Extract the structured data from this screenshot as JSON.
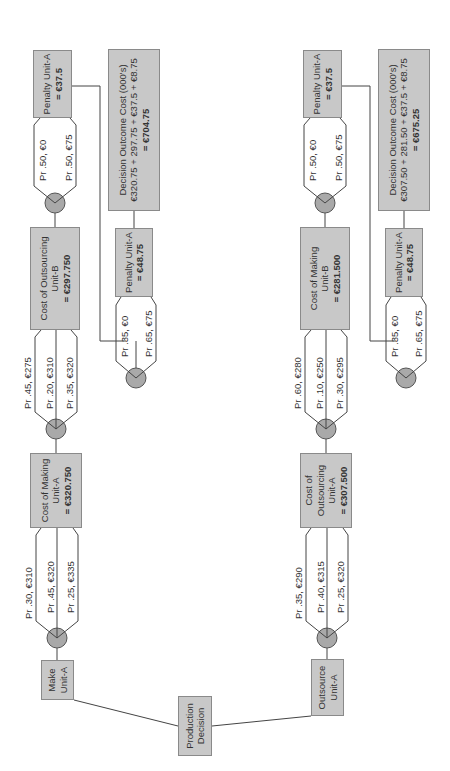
{
  "root": {
    "label_1": "Production",
    "label_2": "Decision"
  },
  "branches": [
    {
      "decision_1": "Make",
      "decision_2": "Unit-A",
      "stage1": {
        "outcomes": [
          "Pr .30, €310",
          "Pr .45, €320",
          "Pr .25, €335"
        ],
        "box_line1": "Cost of Making",
        "box_line2": "Unit-A",
        "box_value": "= €320.750"
      },
      "stage2": {
        "outcomes": [
          "Pr .45, €275",
          "Pr .20, €310",
          "Pr .35, €320"
        ],
        "box_line1": "Cost of Outsourcing",
        "box_line2": "Unit-B",
        "box_value": "= €297.750"
      },
      "penalty_low": {
        "outcomes": [
          "Pr .35, €0",
          "Pr .65, €75"
        ],
        "box_line1": "Penalty Unit-A",
        "box_value": "= €48.75"
      },
      "penalty_high": {
        "outcomes": [
          "Pr .50, €0",
          "Pr .50, €75"
        ],
        "box_line1": "Penalty Unit-A",
        "box_value": "= €37.5"
      },
      "outcome": {
        "title": "Decision  Outcome Cost (000's)",
        "formula": "€320.75 + 297.75 + €37.5 + €8.75",
        "total": "= €704.75"
      }
    },
    {
      "decision_1": "Outsource",
      "decision_2": "Unit-A",
      "stage1": {
        "outcomes": [
          "Pr .35, €290",
          "Pr .40, €315",
          "Pr .25, €320"
        ],
        "box_line1": "Cost of",
        "box_line2": "Outsourcing",
        "box_line3": "Unit-A",
        "box_value": "= €307.500"
      },
      "stage2": {
        "outcomes": [
          "Pr .60, €280",
          "Pr .10, €250",
          "Pr .30, €295"
        ],
        "box_line1": "Cost of Making",
        "box_line2": "Unit-B",
        "box_value": "= €281.500"
      },
      "penalty_low": {
        "outcomes": [
          "Pr .35, €0",
          "Pr .65, €75"
        ],
        "box_line1": "Penalty Unit-A",
        "box_value": "= €48.75"
      },
      "penalty_high": {
        "outcomes": [
          "Pr .50, €0",
          "Pr .50, €75"
        ],
        "box_line1": "Penalty Unit-A",
        "box_value": "= €37.5"
      },
      "outcome": {
        "title": "Decision  Outcome Cost (000's)",
        "formula": "€307.50 + 281.50 + €37.5 + €8.75",
        "total": "= €675.25"
      }
    }
  ],
  "colors": {
    "box_fill": "#c8c8c8",
    "chance_node": "#a9a9a9",
    "line": "#444444"
  }
}
